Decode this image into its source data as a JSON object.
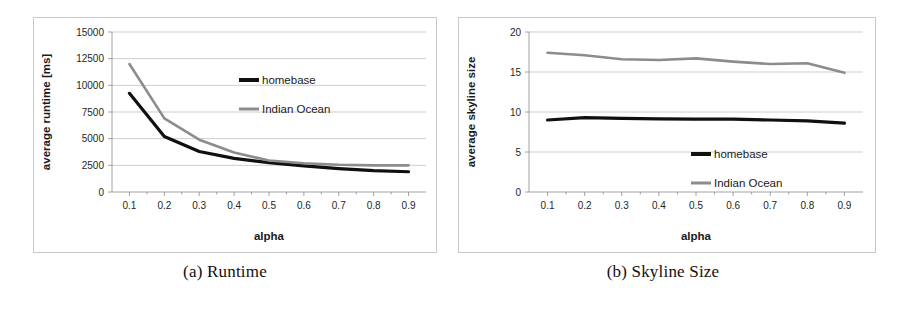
{
  "figure": {
    "panels": [
      {
        "id": "a",
        "caption": "(a) Runtime"
      },
      {
        "id": "b",
        "caption": "(b) Skyline Size"
      }
    ]
  },
  "chart_data": [
    {
      "type": "line",
      "title": "",
      "panel_label": "(a) Runtime",
      "xlabel": "alpha",
      "ylabel": "average runtime [ms]",
      "x": [
        0.1,
        0.2,
        0.3,
        0.4,
        0.5,
        0.6,
        0.7,
        0.8,
        0.9
      ],
      "xticklabels": [
        "0.1",
        "0.2",
        "0.3",
        "0.4",
        "0.5",
        "0.6",
        "0.7",
        "0.8",
        "0.9"
      ],
      "yticklabels": [
        "0",
        "2500",
        "5000",
        "7500",
        "10000",
        "12500",
        "15000"
      ],
      "yticks": [
        0,
        2500,
        5000,
        7500,
        10000,
        12500,
        15000
      ],
      "xlim": [
        0.05,
        0.95
      ],
      "ylim": [
        0,
        15000
      ],
      "grid": true,
      "legend_position": "upper-right-inside",
      "series": [
        {
          "name": "homebase",
          "color": "#101010",
          "values": [
            9250,
            5200,
            3800,
            3150,
            2750,
            2450,
            2200,
            2000,
            1900
          ]
        },
        {
          "name": "Indian Ocean",
          "color": "#8c8c8c",
          "values": [
            12000,
            6900,
            4900,
            3700,
            2950,
            2700,
            2550,
            2500,
            2500
          ]
        }
      ]
    },
    {
      "type": "line",
      "title": "",
      "panel_label": "(b) Skyline Size",
      "xlabel": "alpha",
      "ylabel": "average skyline size",
      "x": [
        0.1,
        0.2,
        0.3,
        0.4,
        0.5,
        0.6,
        0.7,
        0.8,
        0.9
      ],
      "xticklabels": [
        "0.1",
        "0.2",
        "0.3",
        "0.4",
        "0.5",
        "0.6",
        "0.7",
        "0.8",
        "0.9"
      ],
      "yticklabels": [
        "0",
        "5",
        "10",
        "15",
        "20"
      ],
      "yticks": [
        0,
        5,
        10,
        15,
        20
      ],
      "xlim": [
        0.05,
        0.95
      ],
      "ylim": [
        0,
        20
      ],
      "grid": true,
      "legend_position": "lower-right-inside",
      "series": [
        {
          "name": "homebase",
          "color": "#101010",
          "values": [
            9.0,
            9.3,
            9.2,
            9.15,
            9.1,
            9.1,
            9.0,
            8.9,
            8.6
          ]
        },
        {
          "name": "Indian Ocean",
          "color": "#8c8c8c",
          "values": [
            17.4,
            17.1,
            16.6,
            16.5,
            16.7,
            16.3,
            16.0,
            16.1,
            14.9
          ]
        }
      ]
    }
  ]
}
